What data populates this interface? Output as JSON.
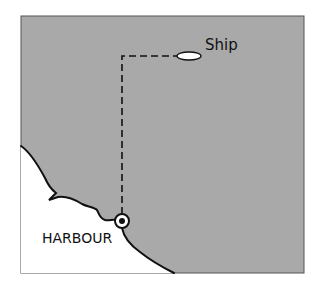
{
  "diagram": {
    "type": "map",
    "labels": {
      "ship": "Ship",
      "harbour": "HARBOUR"
    },
    "colors": {
      "sea": "#a9a9a9",
      "land": "#ffffff",
      "outline": "#111111",
      "ship_fill": "#ffffff"
    },
    "elements": [
      {
        "name": "ship",
        "shape": "ellipse"
      },
      {
        "name": "harbour",
        "shape": "circle-dot marker"
      },
      {
        "name": "route",
        "style": "dashed",
        "description": "path from harbour north then east to ship"
      },
      {
        "name": "coastline",
        "style": "solid"
      }
    ]
  }
}
